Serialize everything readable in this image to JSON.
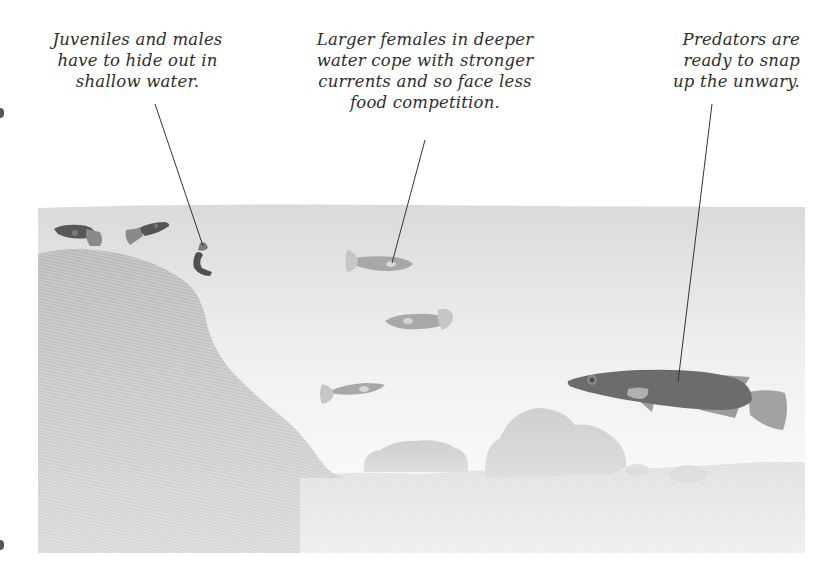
{
  "captions": {
    "juveniles": {
      "lines": [
        "Juveniles and males",
        "have to hide out in",
        "shallow water."
      ]
    },
    "females": {
      "lines": [
        "Larger females in deeper",
        "water cope with stronger",
        "currents and so face less",
        "food competition."
      ]
    },
    "predators": {
      "lines": [
        "Predators are",
        "ready to snap",
        "up the unwary."
      ]
    }
  },
  "scene": {
    "description": "Cross-section of a stream: shallow bank on the left, deeper water to the right, rocks on the bottom",
    "colors": {
      "water_top": "#dcdcdc",
      "water_bottom": "#ffffff",
      "bank": "#bdbdbd",
      "bed": "#e4e4e4",
      "rock": "#d2d2d2",
      "male_fish": "#5a5a5a",
      "male_tail": "#8c8c8c",
      "female_fish": "#a8a8a8",
      "female_fin": "#c4c4c4",
      "predator_body": "#6e6e6e",
      "predator_fin": "#9c9c9c",
      "leader_line": "#333333"
    },
    "groups": [
      {
        "name": "juveniles-and-males",
        "count": 3,
        "zone": "shallow water"
      },
      {
        "name": "larger-females",
        "count": 3,
        "zone": "deeper water"
      },
      {
        "name": "predator",
        "count": 1,
        "zone": "deep water"
      }
    ]
  }
}
